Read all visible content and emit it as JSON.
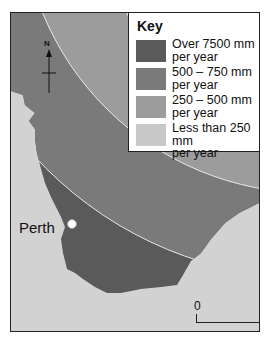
{
  "map": {
    "title": "Annual rainfall in south-west Western Australia",
    "colors": {
      "background": "#d2d2d2",
      "zone_over_7500": "#5a5a5a",
      "zone_500_750": "#7a7a7a",
      "zone_250_500": "#9c9c9c",
      "zone_less_250": "#c8c8c8",
      "zone_boundary": "#e8e8e8"
    },
    "compass": {
      "label": "N"
    },
    "city": {
      "name": "Perth"
    },
    "scale": {
      "start": "0",
      "end": "300 km"
    }
  },
  "key": {
    "title": "Key",
    "items": [
      {
        "label_line1": "Over 7500 mm",
        "label_line2": "per year",
        "color": "#5a5a5a"
      },
      {
        "label_line1": "500 – 750 mm",
        "label_line2": "per year",
        "color": "#7a7a7a"
      },
      {
        "label_line1": "250 – 500 mm",
        "label_line2": "per year",
        "color": "#9c9c9c"
      },
      {
        "label_line1": "Less than 250 mm",
        "label_line2": "per year",
        "color": "#c8c8c8"
      }
    ]
  }
}
